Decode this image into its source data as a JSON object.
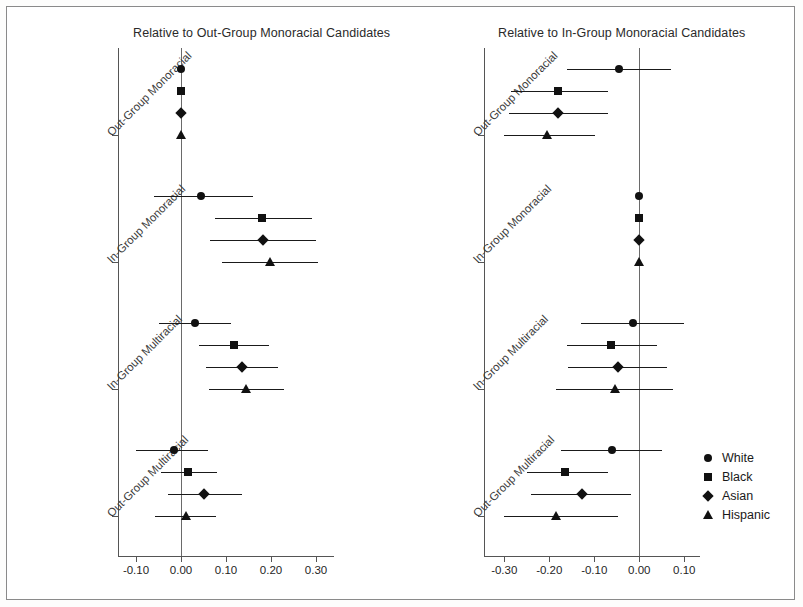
{
  "figure": {
    "width": 803,
    "height": 607,
    "background": "#ffffff",
    "frame_color": "#8a8a8a",
    "marker_color": "#111111"
  },
  "legend": {
    "position": "bottom-right",
    "entries": [
      {
        "label": "White",
        "marker": "circle"
      },
      {
        "label": "Black",
        "marker": "square"
      },
      {
        "label": "Asian",
        "marker": "diamond"
      },
      {
        "label": "Hispanic",
        "marker": "triangle"
      }
    ]
  },
  "chart_data": [
    {
      "type": "scatter",
      "subtype": "dot-and-whisker coefficient plot",
      "panel": "left",
      "title": "Relative to Out-Group Monoracial Candidates",
      "xlabel": "",
      "ylabel": "",
      "xlim": [
        -0.14,
        0.34
      ],
      "xticks": [
        -0.1,
        0.0,
        0.1,
        0.2,
        0.3
      ],
      "xticklabels": [
        "-0.10",
        "0.00",
        "0.10",
        "0.20",
        "0.30"
      ],
      "grid": false,
      "reference_line": 0.0,
      "categories": [
        "Out-Group Monoracial",
        "In-Group Monoracial",
        "In-Group Multiracial",
        "Out-Group Multiracial"
      ],
      "series": [
        {
          "name": "White",
          "marker": "circle",
          "points": [
            {
              "category": "Out-Group Monoracial",
              "estimate": 0.0,
              "lower": 0.0,
              "upper": 0.0
            },
            {
              "category": "In-Group Monoracial",
              "estimate": 0.045,
              "lower": -0.06,
              "upper": 0.16
            },
            {
              "category": "In-Group Multiracial",
              "estimate": 0.03,
              "lower": -0.05,
              "upper": 0.11
            },
            {
              "category": "Out-Group Multiracial",
              "estimate": -0.015,
              "lower": -0.1,
              "upper": 0.06
            }
          ]
        },
        {
          "name": "Black",
          "marker": "square",
          "points": [
            {
              "category": "Out-Group Monoracial",
              "estimate": 0.0,
              "lower": 0.0,
              "upper": 0.0
            },
            {
              "category": "In-Group Monoracial",
              "estimate": 0.18,
              "lower": 0.075,
              "upper": 0.29
            },
            {
              "category": "In-Group Multiracial",
              "estimate": 0.118,
              "lower": 0.04,
              "upper": 0.195
            },
            {
              "category": "Out-Group Multiracial",
              "estimate": 0.015,
              "lower": -0.045,
              "upper": 0.08
            }
          ]
        },
        {
          "name": "Asian",
          "marker": "diamond",
          "points": [
            {
              "category": "Out-Group Monoracial",
              "estimate": 0.0,
              "lower": 0.0,
              "upper": 0.0
            },
            {
              "category": "In-Group Monoracial",
              "estimate": 0.182,
              "lower": 0.065,
              "upper": 0.3
            },
            {
              "category": "In-Group Multiracial",
              "estimate": 0.135,
              "lower": 0.055,
              "upper": 0.215
            },
            {
              "category": "Out-Group Multiracial",
              "estimate": 0.052,
              "lower": -0.028,
              "upper": 0.135
            }
          ]
        },
        {
          "name": "Hispanic",
          "marker": "triangle",
          "points": [
            {
              "category": "Out-Group Monoracial",
              "estimate": 0.0,
              "lower": 0.0,
              "upper": 0.0
            },
            {
              "category": "In-Group Monoracial",
              "estimate": 0.198,
              "lower": 0.09,
              "upper": 0.305
            },
            {
              "category": "In-Group Multiracial",
              "estimate": 0.145,
              "lower": 0.062,
              "upper": 0.228
            },
            {
              "category": "Out-Group Multiracial",
              "estimate": 0.01,
              "lower": -0.058,
              "upper": 0.078
            }
          ]
        }
      ]
    },
    {
      "type": "scatter",
      "subtype": "dot-and-whisker coefficient plot",
      "panel": "right",
      "title": "Relative to In-Group Monoracial Candidates",
      "xlabel": "",
      "ylabel": "",
      "xlim": [
        -0.345,
        0.135
      ],
      "xticks": [
        -0.3,
        -0.2,
        -0.1,
        0.0,
        0.1
      ],
      "xticklabels": [
        "-0.30",
        "-0.20",
        "-0.10",
        "0.00",
        "0.10"
      ],
      "grid": false,
      "reference_line": 0.0,
      "categories": [
        "Out-Group Monoracial",
        "In-Group Monoracial",
        "In-Group Multiracial",
        "Out-Group Multiracial"
      ],
      "series": [
        {
          "name": "White",
          "marker": "circle",
          "points": [
            {
              "category": "Out-Group Monoracial",
              "estimate": -0.045,
              "lower": -0.16,
              "upper": 0.07
            },
            {
              "category": "In-Group Monoracial",
              "estimate": 0.0,
              "lower": 0.0,
              "upper": 0.0
            },
            {
              "category": "In-Group Multiracial",
              "estimate": -0.013,
              "lower": -0.13,
              "upper": 0.1
            },
            {
              "category": "Out-Group Multiracial",
              "estimate": -0.06,
              "lower": -0.175,
              "upper": 0.05
            }
          ]
        },
        {
          "name": "Black",
          "marker": "square",
          "points": [
            {
              "category": "Out-Group Monoracial",
              "estimate": -0.18,
              "lower": -0.285,
              "upper": -0.07
            },
            {
              "category": "In-Group Monoracial",
              "estimate": 0.0,
              "lower": 0.0,
              "upper": 0.0
            },
            {
              "category": "In-Group Multiracial",
              "estimate": -0.062,
              "lower": -0.16,
              "upper": 0.04
            },
            {
              "category": "Out-Group Multiracial",
              "estimate": -0.165,
              "lower": -0.25,
              "upper": -0.07
            }
          ]
        },
        {
          "name": "Asian",
          "marker": "diamond",
          "points": [
            {
              "category": "Out-Group Monoracial",
              "estimate": -0.18,
              "lower": -0.29,
              "upper": -0.07
            },
            {
              "category": "In-Group Monoracial",
              "estimate": 0.0,
              "lower": 0.0,
              "upper": 0.0
            },
            {
              "category": "In-Group Multiracial",
              "estimate": -0.048,
              "lower": -0.158,
              "upper": 0.062
            },
            {
              "category": "Out-Group Multiracial",
              "estimate": -0.128,
              "lower": -0.24,
              "upper": -0.018
            }
          ]
        },
        {
          "name": "Hispanic",
          "marker": "triangle",
          "points": [
            {
              "category": "Out-Group Monoracial",
              "estimate": -0.205,
              "lower": -0.3,
              "upper": -0.098
            },
            {
              "category": "In-Group Monoracial",
              "estimate": 0.0,
              "lower": 0.0,
              "upper": 0.0
            },
            {
              "category": "In-Group Multiracial",
              "estimate": -0.055,
              "lower": -0.185,
              "upper": 0.075
            },
            {
              "category": "Out-Group Multiracial",
              "estimate": -0.185,
              "lower": -0.3,
              "upper": -0.048
            }
          ]
        }
      ]
    }
  ]
}
